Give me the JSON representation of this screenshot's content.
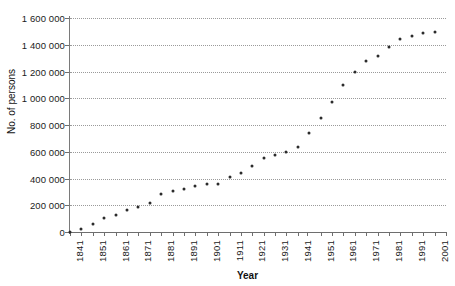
{
  "chart_data": {
    "type": "scatter",
    "title": "",
    "xlabel": "Year",
    "ylabel": "No. of persons",
    "xlim": [
      1841,
      2006
    ],
    "ylim": [
      0,
      1600000
    ],
    "grid": true,
    "legend": null,
    "y_ticks": [
      0,
      200000,
      400000,
      600000,
      800000,
      1000000,
      1200000,
      1400000,
      1600000
    ],
    "y_tick_labels": [
      "0",
      "200 000",
      "400 000",
      "600 000",
      "800 000",
      "1 000 000",
      "1 200 000",
      "1 400 000",
      "1 600 000"
    ],
    "x_ticks": [
      1841,
      1846,
      1851,
      1856,
      1861,
      1866,
      1871,
      1876,
      1881,
      1886,
      1891,
      1896,
      1901,
      1906,
      1911,
      1916,
      1921,
      1926,
      1931,
      1936,
      1941,
      1945,
      1951,
      1956,
      1961,
      1966,
      1971,
      1976,
      1981,
      1986,
      1991,
      1996,
      2001,
      2006
    ],
    "x_tick_labels": [
      "1841",
      "1851",
      "1861",
      "1871",
      "1881",
      "1891",
      "1901",
      "1911",
      "1921",
      "1931",
      "1941",
      "1951",
      "1961",
      "1971",
      "1981",
      "1991",
      "2001"
    ],
    "x_tick_label_years": [
      1841,
      1851,
      1861,
      1871,
      1881,
      1891,
      1901,
      1911,
      1921,
      1931,
      1941,
      1951,
      1961,
      1971,
      1981,
      1991,
      2001
    ],
    "marker": "dot",
    "marker_color": "#2b2b2b",
    "gridline_color": "#9a9a9a",
    "series": [
      {
        "name": "Population",
        "x": [
          1841,
          1846,
          1851,
          1856,
          1861,
          1866,
          1871,
          1876,
          1881,
          1886,
          1891,
          1896,
          1901,
          1906,
          1911,
          1916,
          1921,
          1926,
          1931,
          1936,
          1941,
          1945,
          1951,
          1956,
          1961,
          1966,
          1971,
          1976,
          1981,
          1986,
          1991,
          1996,
          2001,
          2006
        ],
        "values": [
          2000,
          22000,
          63000,
          102000,
          127000,
          163000,
          190000,
          220000,
          283000,
          307000,
          320000,
          345000,
          356000,
          362000,
          413000,
          442000,
          495000,
          554000,
          576000,
          601000,
          635000,
          740000,
          855000,
          970000,
          1098000,
          1200000,
          1275000,
          1318000,
          1380000,
          1445000,
          1468000,
          1486000,
          1495000,
          1500000
        ]
      }
    ],
    "points": [
      {
        "year": 1841,
        "value": 2000
      },
      {
        "year": 1846,
        "value": 22000
      },
      {
        "year": 1851,
        "value": 63000
      },
      {
        "year": 1856,
        "value": 102000
      },
      {
        "year": 1861,
        "value": 127000
      },
      {
        "year": 1866,
        "value": 163000
      },
      {
        "year": 1871,
        "value": 190000
      },
      {
        "year": 1876,
        "value": 220000
      },
      {
        "year": 1881,
        "value": 283000
      },
      {
        "year": 1886,
        "value": 307000
      },
      {
        "year": 1891,
        "value": 320000
      },
      {
        "year": 1896,
        "value": 345000
      },
      {
        "year": 1901,
        "value": 356000
      },
      {
        "year": 1906,
        "value": 362000
      },
      {
        "year": 1911,
        "value": 413000
      },
      {
        "year": 1916,
        "value": 442000
      },
      {
        "year": 1921,
        "value": 495000
      },
      {
        "year": 1926,
        "value": 554000
      },
      {
        "year": 1931,
        "value": 576000
      },
      {
        "year": 1936,
        "value": 601000
      },
      {
        "year": 1941,
        "value": 635000
      },
      {
        "year": 1946,
        "value": 740000
      },
      {
        "year": 1951,
        "value": 855000
      },
      {
        "year": 1956,
        "value": 970000
      },
      {
        "year": 1961,
        "value": 1098000
      },
      {
        "year": 1966,
        "value": 1200000
      },
      {
        "year": 1971,
        "value": 1275000
      },
      {
        "year": 1976,
        "value": 1318000
      },
      {
        "year": 1981,
        "value": 1380000
      },
      {
        "year": 1986,
        "value": 1445000
      },
      {
        "year": 1991,
        "value": 1468000
      },
      {
        "year": 1996,
        "value": 1486000
      },
      {
        "year": 2001,
        "value": 1495000
      }
    ]
  }
}
